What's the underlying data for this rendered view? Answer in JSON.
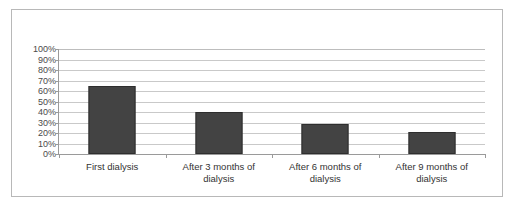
{
  "chart_data": {
    "type": "bar",
    "title": "",
    "subtitle": "",
    "xlabel": "",
    "ylabel": "",
    "categories": [
      "First dialysis",
      "After 3 months of dialysis",
      "After 6 months of dialysis",
      "After 9 months of dialysis"
    ],
    "values": [
      65,
      40,
      29,
      21
    ],
    "ylim": [
      0,
      100
    ],
    "ytick_labels": [
      "100%",
      "90%",
      "80%",
      "70%",
      "60%",
      "50%",
      "40%",
      "30%",
      "20%",
      "10%",
      "0%"
    ],
    "ytick_values": [
      100,
      90,
      80,
      70,
      60,
      50,
      40,
      30,
      20,
      10,
      0
    ],
    "grid": true,
    "legend": false,
    "legend_position": "none",
    "series": [
      {
        "name": "",
        "values": [
          65,
          40,
          29,
          21
        ]
      }
    ],
    "colors": {
      "bar_fill": "#434343",
      "bar_border": "#2e2e2e",
      "gridline": "#c9c9c9",
      "axis_line": "#9a9a9a",
      "frame_border": "#b8b8b8",
      "background": "#ffffff",
      "tick_label": "#4a4a4a",
      "category_label": "#333333"
    }
  }
}
